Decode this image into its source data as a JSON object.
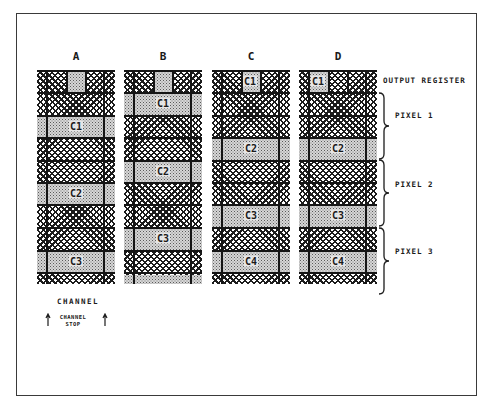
{
  "diagram": {
    "type": "ccd-readout-schematic",
    "columns": [
      {
        "label": "A"
      },
      {
        "label": "B"
      },
      {
        "label": "C"
      },
      {
        "label": "D"
      }
    ],
    "charge_tags": {
      "A": [
        "C1",
        "C2",
        "C3"
      ],
      "B": [
        "C1",
        "C2",
        "C3"
      ],
      "C": [
        "C1",
        "C2",
        "C3",
        "C4"
      ],
      "D": [
        "C1",
        "C2",
        "C3",
        "C4"
      ]
    },
    "side_labels": {
      "output_register": "OUTPUT REGISTER",
      "pixel_1": "PIXEL 1",
      "pixel_2": "PIXEL 2",
      "pixel_3": "PIXEL 3"
    },
    "legend": {
      "channel": "CHANNEL",
      "channel_stop_line1": "CHANNEL",
      "channel_stop_line2": "STOP"
    },
    "colors": {
      "ink": "#1c1c1c",
      "stipple_fill": "#d6d6d6",
      "frame": "#3a3a3a"
    }
  }
}
